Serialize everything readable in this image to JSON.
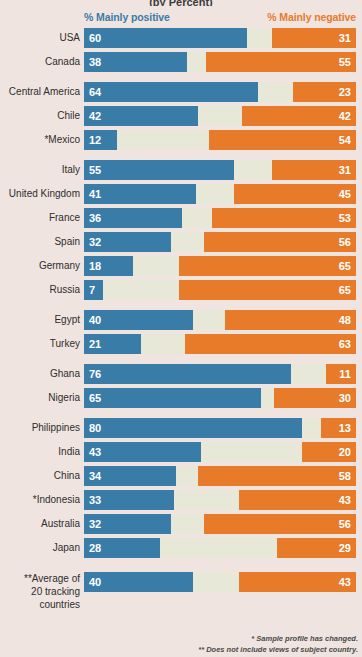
{
  "title": "(by Percent)",
  "legend": {
    "positive": "% Mainly positive",
    "negative": "% Mainly negative",
    "positive_color": "#3a7ca8",
    "negative_color": "#e87b2a",
    "track_color": "#e8e8d8",
    "background_color": "#f0e4e0"
  },
  "footnotes": {
    "one": "* Sample profile has changed.",
    "two": "** Does not include views of subject country."
  },
  "average": {
    "label_line1": "**Average of",
    "label_line2": "20 tracking",
    "label_line3": "countries",
    "positive": 40,
    "negative": 43
  },
  "chart_data": {
    "type": "bar",
    "title": "(by Percent)",
    "xlabel": "",
    "ylabel": "",
    "xlim": [
      0,
      100
    ],
    "grid": false,
    "legend_position": "top",
    "series": [
      {
        "name": "% Mainly positive",
        "color": "#3a7ca8"
      },
      {
        "name": "% Mainly negative",
        "color": "#e87b2a"
      }
    ],
    "groups": [
      {
        "rows": [
          {
            "label": "USA",
            "positive": 60,
            "negative": 31
          },
          {
            "label": "Canada",
            "positive": 38,
            "negative": 55
          }
        ]
      },
      {
        "rows": [
          {
            "label": "Central America",
            "positive": 64,
            "negative": 23
          },
          {
            "label": "Chile",
            "positive": 42,
            "negative": 42
          },
          {
            "label": "*Mexico",
            "positive": 12,
            "negative": 54
          }
        ]
      },
      {
        "rows": [
          {
            "label": "Italy",
            "positive": 55,
            "negative": 31
          },
          {
            "label": "United Kingdom",
            "positive": 41,
            "negative": 45
          },
          {
            "label": "France",
            "positive": 36,
            "negative": 53
          },
          {
            "label": "Spain",
            "positive": 32,
            "negative": 56
          },
          {
            "label": "Germany",
            "positive": 18,
            "negative": 65
          },
          {
            "label": "Russia",
            "positive": 7,
            "negative": 65
          }
        ]
      },
      {
        "rows": [
          {
            "label": "Egypt",
            "positive": 40,
            "negative": 48
          },
          {
            "label": "Turkey",
            "positive": 21,
            "negative": 63
          }
        ]
      },
      {
        "rows": [
          {
            "label": "Ghana",
            "positive": 76,
            "negative": 11
          },
          {
            "label": "Nigeria",
            "positive": 65,
            "negative": 30
          }
        ]
      },
      {
        "rows": [
          {
            "label": "Philippines",
            "positive": 80,
            "negative": 13
          },
          {
            "label": "India",
            "positive": 43,
            "negative": 20
          },
          {
            "label": "China",
            "positive": 34,
            "negative": 58
          },
          {
            "label": "*Indonesia",
            "positive": 33,
            "negative": 43
          },
          {
            "label": "Australia",
            "positive": 32,
            "negative": 56
          },
          {
            "label": "Japan",
            "positive": 28,
            "negative": 29
          }
        ]
      }
    ]
  }
}
